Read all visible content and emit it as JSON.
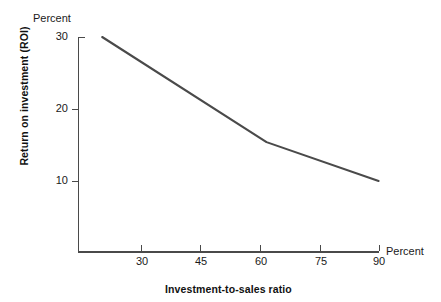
{
  "chart_data": {
    "type": "line",
    "title": "",
    "xlabel": "Investment-to-sales ratio",
    "ylabel": "Return on investment (ROI)",
    "x_unit_label": "Percent",
    "y_unit_label": "Percent",
    "xlim": [
      20,
      90
    ],
    "ylim": [
      0,
      30
    ],
    "grid": false,
    "legend": null,
    "x_ticks": [
      {
        "value": 30,
        "label": "30"
      },
      {
        "value": 45,
        "label": "45"
      },
      {
        "value": 60,
        "label": "60"
      },
      {
        "value": 75,
        "label": "75"
      },
      {
        "value": 90,
        "label": "90"
      }
    ],
    "y_ticks": [
      {
        "value": 30,
        "label": "30"
      },
      {
        "value": 20,
        "label": "20"
      },
      {
        "value": 10,
        "label": "10"
      }
    ],
    "series": [
      {
        "name": "ROI vs investment-to-sales ratio",
        "color": "#4a4a4a",
        "x": [
          20.2,
          61.7,
          90
        ],
        "values": [
          30,
          15.4,
          10
        ],
        "points": [
          {
            "x": 20.2,
            "y": 30
          },
          {
            "x": 61.7,
            "y": 15.4
          },
          {
            "x": 90,
            "y": 10
          }
        ]
      }
    ]
  },
  "colors": {
    "line": "#4a4a4a",
    "axis": "#4a4a4a",
    "text": "#1a1a1a",
    "title_text": "#111111",
    "background": "#ffffff"
  }
}
